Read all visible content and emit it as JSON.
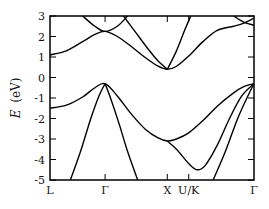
{
  "chart_data": {
    "type": "line",
    "title": "",
    "xlabel": "",
    "ylabel": "E (eV)",
    "ylabel_italic_part": "E",
    "ylabel_unit_part": "(eV)",
    "ylim": [
      -5,
      3
    ],
    "yticks": [
      3,
      2,
      1,
      0,
      -1,
      -2,
      -3,
      -4,
      -5
    ],
    "x_kpoints": [
      {
        "label": "L",
        "pos": 0.0
      },
      {
        "label": "Γ",
        "pos": 0.27
      },
      {
        "label": "X",
        "pos": 0.575
      },
      {
        "label": "U/K",
        "pos": 0.68
      },
      {
        "label": "Γ",
        "pos": 1.0
      }
    ],
    "grid": false,
    "legend": "none",
    "series": [
      {
        "name": "conduction band 1",
        "x": [
          0.0,
          0.08,
          0.16,
          0.22,
          0.27,
          0.33,
          0.4,
          0.47,
          0.53,
          0.575,
          0.62,
          0.68,
          0.75,
          0.82,
          0.9,
          0.95,
          1.0
        ],
        "y": [
          1.1,
          1.3,
          1.75,
          2.1,
          2.25,
          2.0,
          1.5,
          0.95,
          0.55,
          0.4,
          0.55,
          1.05,
          1.75,
          2.3,
          2.5,
          2.65,
          2.9
        ]
      },
      {
        "name": "conduction band 2",
        "x": [
          0.16,
          0.22,
          0.27,
          0.33,
          0.38
        ],
        "y": [
          3.0,
          2.5,
          2.25,
          2.5,
          3.0
        ]
      },
      {
        "name": "conduction band 3",
        "x": [
          0.36,
          0.42,
          0.48,
          0.53,
          0.575
        ],
        "y": [
          3.0,
          2.2,
          1.4,
          0.8,
          0.4
        ]
      },
      {
        "name": "conduction band 4",
        "x": [
          0.575,
          0.62,
          0.66,
          0.69
        ],
        "y": [
          0.4,
          1.3,
          2.3,
          3.0
        ]
      },
      {
        "name": "conduction band 5",
        "x": [
          0.9,
          0.95,
          1.0
        ],
        "y": [
          3.0,
          2.7,
          2.55
        ]
      },
      {
        "name": "valence band 1",
        "x": [
          0.0,
          0.08,
          0.16,
          0.22,
          0.27,
          0.33,
          0.4,
          0.47,
          0.53,
          0.575,
          0.62,
          0.68,
          0.75,
          0.82,
          0.9,
          0.95,
          1.0
        ],
        "y": [
          -1.5,
          -1.35,
          -0.95,
          -0.5,
          -0.3,
          -0.9,
          -1.8,
          -2.55,
          -2.95,
          -3.1,
          -3.0,
          -2.7,
          -2.1,
          -1.4,
          -0.75,
          -0.45,
          -0.3
        ]
      },
      {
        "name": "valence band 2 (steep left)",
        "x": [
          0.1,
          0.15,
          0.2,
          0.24,
          0.27
        ],
        "y": [
          -5.0,
          -3.6,
          -2.0,
          -0.9,
          -0.3
        ]
      },
      {
        "name": "valence band 3 (steep right)",
        "x": [
          0.27,
          0.3,
          0.34,
          0.38,
          0.43
        ],
        "y": [
          -0.3,
          -1.1,
          -2.3,
          -3.6,
          -5.0
        ]
      },
      {
        "name": "valence band 4",
        "x": [
          0.575,
          0.62,
          0.68,
          0.72,
          0.76,
          0.82,
          0.88,
          0.94,
          1.0
        ],
        "y": [
          -3.1,
          -3.5,
          -4.2,
          -4.5,
          -4.3,
          -3.3,
          -2.0,
          -0.9,
          -0.3
        ]
      },
      {
        "name": "valence band 5 (steep)",
        "x": [
          0.8,
          0.86,
          0.92,
          0.97,
          1.0
        ],
        "y": [
          -5.0,
          -3.6,
          -2.0,
          -0.9,
          -0.3
        ]
      }
    ]
  }
}
